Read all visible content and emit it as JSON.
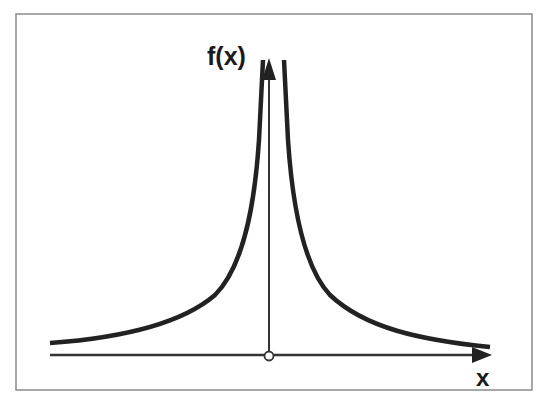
{
  "diagram": {
    "type": "function-graph",
    "y_axis_label": "f(x)",
    "x_axis_label": "x",
    "colors": {
      "curve": "#222222",
      "axes": "#333333",
      "frame": "#888888",
      "background": "#ffffff"
    },
    "features": {
      "open_point_at_origin": true,
      "vertical_asymptote": "x = 0",
      "horizontal_asymptote": "y = 0"
    }
  }
}
